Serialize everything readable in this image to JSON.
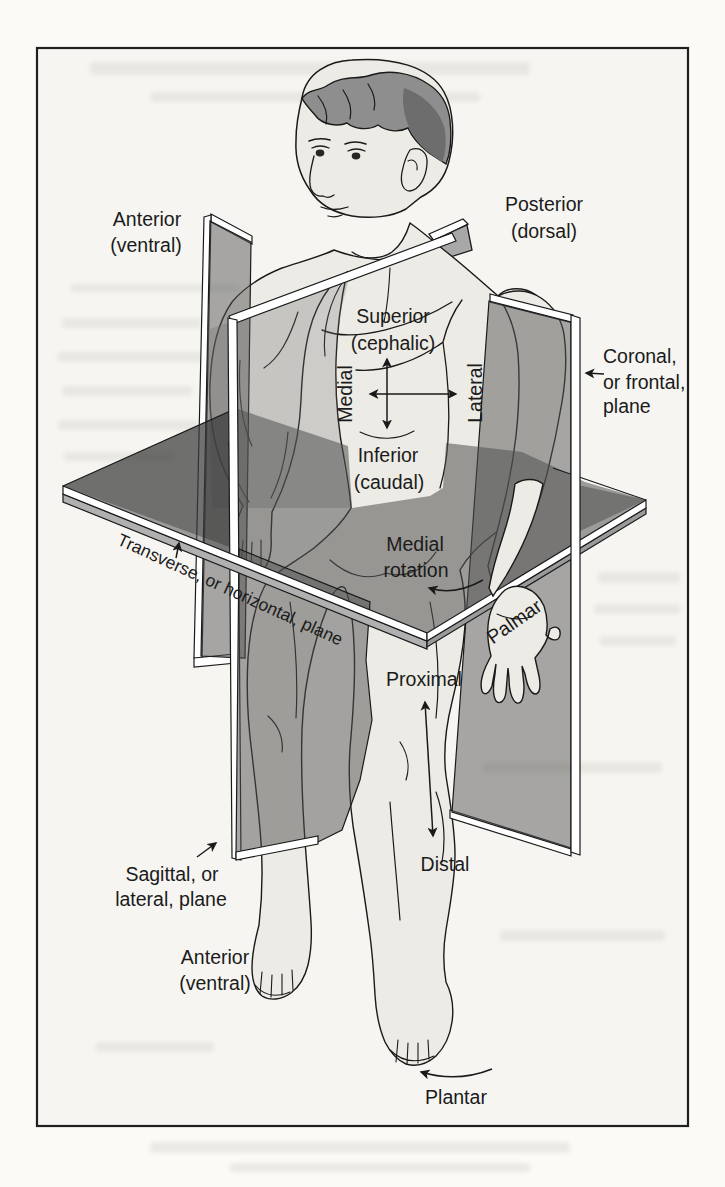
{
  "labels": {
    "anterior_top": [
      "Anterior",
      "(ventral)"
    ],
    "posterior": [
      "Posterior",
      "(dorsal)"
    ],
    "superior": [
      "Superior",
      "(cephalic)"
    ],
    "medial": "Medial",
    "lateral": "Lateral",
    "inferior": [
      "Inferior",
      "(caudal)"
    ],
    "coronal": [
      "Coronal,",
      "or frontal,",
      "plane"
    ],
    "transverse": "Transverse, or horizontal, plane",
    "medial_rotation": [
      "Medial",
      "rotation"
    ],
    "palmar": "Palmar",
    "proximal": "Proximal",
    "distal": "Distal",
    "sagittal": [
      "Sagittal, or",
      "lateral, plane"
    ],
    "anterior_bottom": [
      "Anterior",
      "(ventral)"
    ],
    "plantar": "Plantar"
  },
  "colors": {
    "page_background": "#fbfaf7",
    "panel_background": "#f6f5f1",
    "border": "#1f1f1f",
    "skin": "#edebe5",
    "plane_gray": "#a8a8a8",
    "plane_dark_gray": "#7e7e7e",
    "edge_trim": "#ffffff",
    "hair": "#8e8e8e",
    "hair_dark": "#6d6d6d",
    "outline": "#1a1a1a",
    "text": "#1b1b1b"
  }
}
